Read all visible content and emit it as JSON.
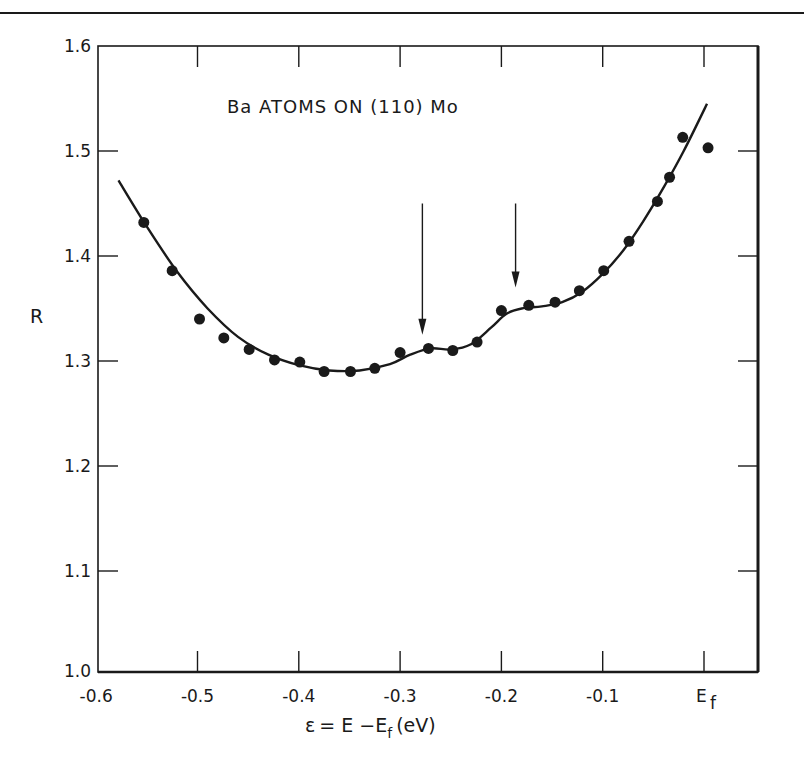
{
  "chart_data": {
    "type": "scatter",
    "title": "Ba ATOMS ON (110) Mo",
    "xlabel": "ε = E − E_f (eV)",
    "ylabel": "R",
    "xlim": [
      -0.6,
      0.05
    ],
    "ylim": [
      1.0,
      1.6
    ],
    "grid": false,
    "legend": null,
    "x_ticks": [
      -0.6,
      -0.5,
      -0.4,
      -0.3,
      -0.2,
      -0.1,
      0.0
    ],
    "x_tick_labels": [
      "-0.6",
      "-0.5",
      "-0.4",
      "-0.3",
      "-0.2",
      "-0.1",
      "E_f"
    ],
    "y_ticks": [
      1.0,
      1.1,
      1.2,
      1.3,
      1.4,
      1.5,
      1.6
    ],
    "y_tick_labels": [
      "1.0",
      "1.1",
      "1.2",
      "1.3",
      "1.4",
      "1.5",
      "1.6"
    ],
    "series": [
      {
        "name": "measured",
        "style": "filled-circle",
        "x": [
          -0.553,
          -0.525,
          -0.498,
          -0.474,
          -0.449,
          -0.424,
          -0.399,
          -0.375,
          -0.349,
          -0.325,
          -0.3,
          -0.272,
          -0.248,
          -0.224,
          -0.2,
          -0.173,
          -0.147,
          -0.123,
          -0.099,
          -0.074,
          -0.046,
          -0.034,
          -0.021,
          0.004
        ],
        "y": [
          1.432,
          1.386,
          1.34,
          1.322,
          1.311,
          1.301,
          1.299,
          1.29,
          1.29,
          1.293,
          1.308,
          1.312,
          1.31,
          1.318,
          1.348,
          1.353,
          1.356,
          1.367,
          1.386,
          1.414,
          1.452,
          1.475,
          1.513,
          1.503
        ]
      },
      {
        "name": "fitted curve",
        "style": "line",
        "x": [
          -0.578,
          -0.55,
          -0.52,
          -0.49,
          -0.46,
          -0.43,
          -0.4,
          -0.37,
          -0.34,
          -0.31,
          -0.29,
          -0.27,
          -0.25,
          -0.23,
          -0.21,
          -0.195,
          -0.18,
          -0.16,
          -0.14,
          -0.12,
          -0.1,
          -0.08,
          -0.06,
          -0.04,
          -0.02,
          0.003
        ],
        "y": [
          1.472,
          1.428,
          1.385,
          1.35,
          1.323,
          1.306,
          1.296,
          1.291,
          1.291,
          1.297,
          1.306,
          1.312,
          1.311,
          1.316,
          1.332,
          1.345,
          1.35,
          1.352,
          1.356,
          1.366,
          1.383,
          1.405,
          1.433,
          1.465,
          1.5,
          1.545
        ]
      }
    ],
    "annotations": [
      {
        "type": "arrow",
        "x": -0.278,
        "y_from": 1.45,
        "y_to": 1.325
      },
      {
        "type": "arrow",
        "x": -0.186,
        "y_from": 1.45,
        "y_to": 1.37
      }
    ]
  }
}
